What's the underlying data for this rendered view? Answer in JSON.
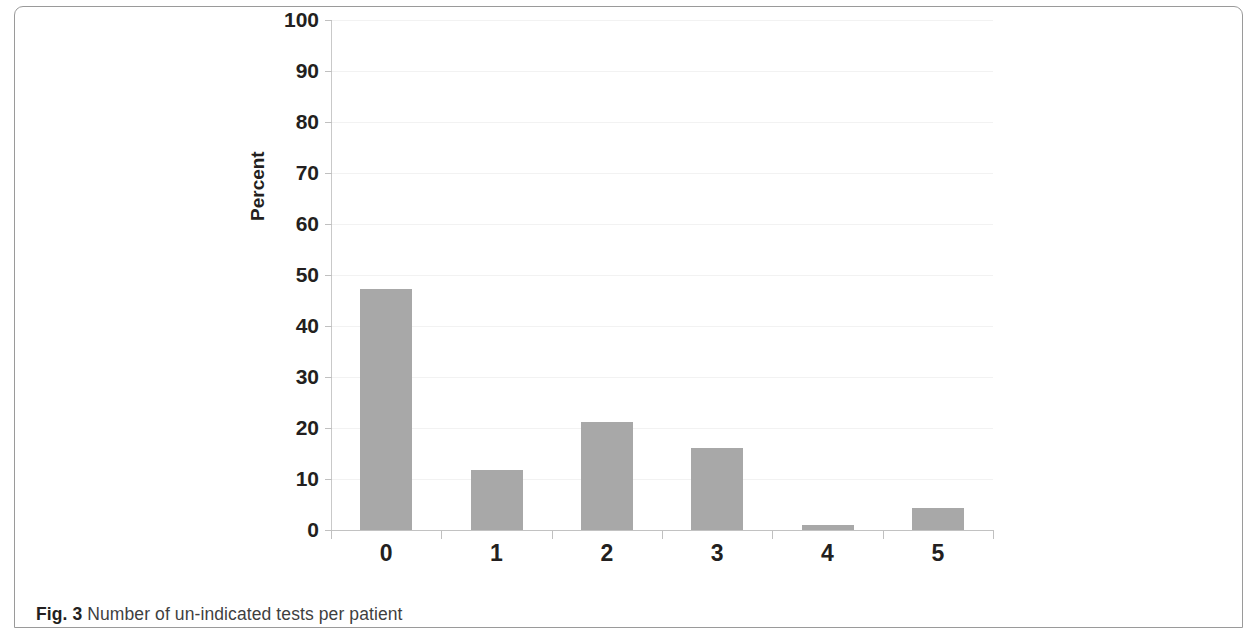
{
  "figure": {
    "caption_label": "Fig. 3",
    "caption_text": "Number of un-indicated tests per patient"
  },
  "colors": {
    "bar_fill": "#a8a8a8",
    "frame_border": "#9a9a9a",
    "axis": "#c2c2c2",
    "gridline": "#f2f2f2",
    "text": "#231f20"
  },
  "chart_data": {
    "type": "bar",
    "title": "",
    "xlabel": "Number of Tests",
    "ylabel": "Percent",
    "categories": [
      "0",
      "1",
      "2",
      "3",
      "4",
      "5"
    ],
    "values": [
      47.3,
      11.7,
      21.2,
      16.0,
      1.0,
      4.4
    ],
    "ylim": [
      0,
      100
    ],
    "ytick_labels": [
      "100",
      "90",
      "80",
      "70",
      "60",
      "50",
      "40",
      "30",
      "20",
      "10",
      "0"
    ],
    "ytick_values": [
      100,
      90,
      80,
      70,
      60,
      50,
      40,
      30,
      20,
      10,
      0
    ],
    "ytick_step": 10,
    "grid": true,
    "legend": null
  }
}
